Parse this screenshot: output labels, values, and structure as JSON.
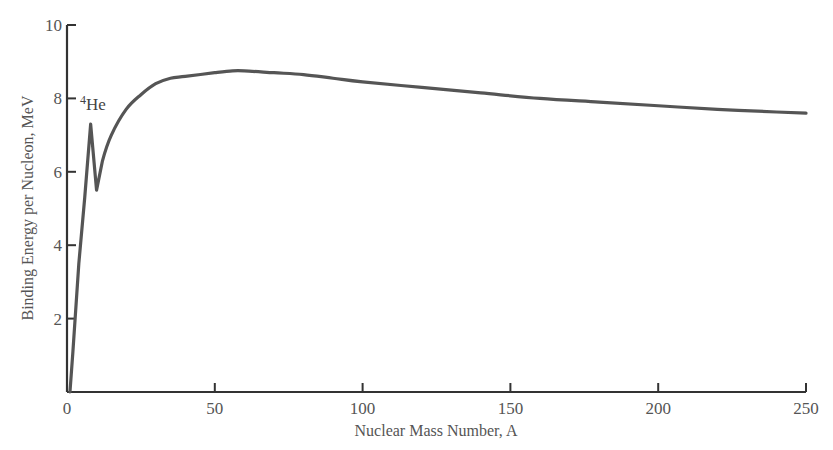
{
  "chart_data": {
    "type": "line",
    "title": "",
    "xlabel": "Nuclear Mass Number, A",
    "ylabel": "Binding Energy per Nucleon, MeV",
    "xlim": [
      0,
      250
    ],
    "ylim": [
      0,
      10
    ],
    "grid": false,
    "legend": null,
    "x_ticks": [
      0,
      50,
      100,
      150,
      200,
      250
    ],
    "y_ticks": [
      2,
      4,
      6,
      8,
      10
    ],
    "x_tick_labels": [
      "0",
      "50",
      "100",
      "150",
      "200",
      "250"
    ],
    "y_tick_labels": [
      "2",
      "4",
      "6",
      "8",
      "10"
    ],
    "annotations": [
      {
        "text_superscript": "4",
        "text": "He",
        "x": 4,
        "y": 7.1
      }
    ],
    "series": [
      {
        "name": "Binding energy per nucleon",
        "color": "#555555",
        "x": [
          1,
          2,
          4,
          6,
          8,
          10,
          12,
          15,
          20,
          25,
          30,
          35,
          40,
          50,
          56,
          60,
          70,
          80,
          90,
          100,
          120,
          140,
          160,
          180,
          200,
          220,
          240,
          250
        ],
        "y": [
          0.0,
          1.1,
          3.5,
          5.3,
          7.3,
          5.5,
          6.3,
          7.0,
          7.7,
          8.1,
          8.4,
          8.55,
          8.6,
          8.7,
          8.75,
          8.75,
          8.7,
          8.65,
          8.55,
          8.45,
          8.3,
          8.15,
          8.0,
          7.9,
          7.8,
          7.7,
          7.63,
          7.6
        ]
      }
    ]
  }
}
